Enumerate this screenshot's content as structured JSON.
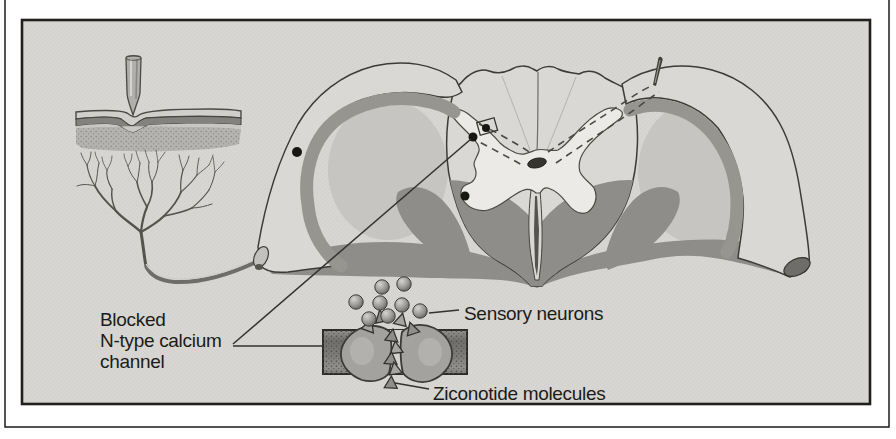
{
  "figure": {
    "labels": {
      "blocked_channel_line1": "Blocked",
      "blocked_channel_line2": "N-type calcium",
      "blocked_channel_line3": "channel",
      "sensory_neurons": "Sensory neurons",
      "ziconotide_molecules": "Ziconotide molecules"
    },
    "colors": {
      "page_background": "#ffffff",
      "panel_background": "#d7d6d2",
      "panel_border": "#21201c",
      "outline": "#3c3b37",
      "tissue_light": "#d9d8d4",
      "tissue_mid": "#c6c5c1",
      "tissue_dark": "#8e8d89",
      "gray_matter": "#ebeae6",
      "text": "#1b1b18"
    }
  }
}
